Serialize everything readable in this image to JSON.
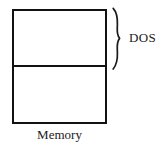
{
  "figure": {
    "caption_below": "Memory",
    "bracket_label": "DOS",
    "ink_color": "#121212",
    "text_color": "#1a1a1a",
    "background_color": "#ffffff"
  },
  "diagram": {
    "type": "memory-layout",
    "box": {
      "name": "memory-rectangle",
      "regions": [
        {
          "name": "upper-region",
          "label": "DOS"
        },
        {
          "name": "lower-region",
          "label": ""
        }
      ]
    },
    "annotations": [
      {
        "name": "dos-brace",
        "icon": "curly-brace-right-icon",
        "spans": "upper-region",
        "label": "DOS"
      }
    ]
  }
}
